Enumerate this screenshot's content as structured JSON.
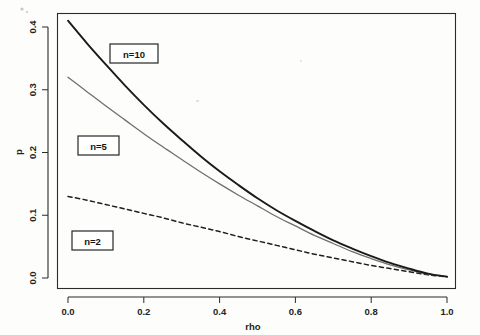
{
  "figure": {
    "name": "rho-vs-p-curves",
    "background_color": "#fdfdfc",
    "frame_color": "#2b2b2b"
  },
  "chart_data": {
    "type": "line",
    "title": "",
    "subtitle": "",
    "xlabel": "rho",
    "ylabel": "p",
    "xlim": [
      0.0,
      1.0
    ],
    "ylim": [
      0.0,
      0.43
    ],
    "grid": false,
    "legend_position": "inline-boxed-annotations",
    "xticks": [
      0.0,
      0.2,
      0.4,
      0.6,
      0.8,
      1.0
    ],
    "xticklabels": [
      "0.0",
      "0.2",
      "0.4",
      "0.6",
      "0.8",
      "1.0"
    ],
    "yticks": [
      0.0,
      0.1,
      0.2,
      0.3,
      0.4
    ],
    "yticklabels": [
      "0.0",
      "0.1",
      "0.2",
      "0.3",
      "0.4"
    ],
    "x": [
      0.0,
      0.05,
      0.1,
      0.15,
      0.2,
      0.25,
      0.3,
      0.35,
      0.4,
      0.45,
      0.5,
      0.55,
      0.6,
      0.65,
      0.7,
      0.75,
      0.8,
      0.85,
      0.9,
      0.95,
      1.0
    ],
    "series": [
      {
        "name": "n=10",
        "linestyle": "solid",
        "color": "#1a1a1a",
        "linewidth": 1.9,
        "values": [
          0.41,
          0.374,
          0.34,
          0.307,
          0.276,
          0.247,
          0.22,
          0.194,
          0.17,
          0.148,
          0.127,
          0.108,
          0.091,
          0.075,
          0.06,
          0.047,
          0.035,
          0.024,
          0.015,
          0.007,
          0.002
        ]
      },
      {
        "name": "n=5",
        "linestyle": "solid",
        "color": "#6e6e6e",
        "linewidth": 1.25,
        "values": [
          0.32,
          0.297,
          0.274,
          0.252,
          0.23,
          0.209,
          0.189,
          0.169,
          0.15,
          0.132,
          0.115,
          0.098,
          0.083,
          0.068,
          0.055,
          0.042,
          0.031,
          0.021,
          0.013,
          0.006,
          0.002
        ]
      },
      {
        "name": "n=2",
        "linestyle": "dashed",
        "color": "#1f1f1f",
        "linewidth": 1.5,
        "values": [
          0.13,
          0.124,
          0.117,
          0.11,
          0.103,
          0.096,
          0.088,
          0.081,
          0.074,
          0.066,
          0.059,
          0.052,
          0.045,
          0.038,
          0.032,
          0.026,
          0.02,
          0.015,
          0.01,
          0.005,
          0.002
        ]
      }
    ],
    "annotations": [
      {
        "name": "n=10",
        "text": "n=10",
        "x": 0.23,
        "y": 0.365
      },
      {
        "name": "n=5",
        "text": "n=5",
        "x": 0.08,
        "y": 0.218
      },
      {
        "name": "n=2",
        "text": "n=2",
        "x": 0.06,
        "y": 0.065
      }
    ]
  }
}
